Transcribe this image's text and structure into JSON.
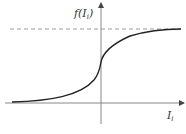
{
  "diagram": {
    "type": "sigmoid-curve",
    "y_axis_label": "f(I",
    "y_axis_label_sub": "i",
    "y_axis_label_close": ")",
    "x_axis_label": "I",
    "x_axis_label_sub": "i",
    "asymptote": "dashed horizontal upper bound",
    "colors": {
      "curve": "#222222",
      "axis": "#888888",
      "dashed": "#999999"
    }
  }
}
